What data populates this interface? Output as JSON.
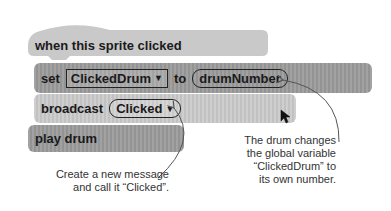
{
  "blocks": {
    "hat": {
      "label": "when this sprite clicked"
    },
    "set": {
      "keyword": "set",
      "variable": "ClickedDrum",
      "to_label": "to",
      "value": "drumNumber"
    },
    "broadcast": {
      "keyword": "broadcast",
      "message": "Clicked"
    },
    "play": {
      "label": "play drum"
    }
  },
  "icons": {
    "dropdown_caret": "▼",
    "cursor": "mouse-pointer"
  },
  "annotations": {
    "left": [
      "Create a new message",
      "and call it “Clicked”."
    ],
    "right": [
      "The drum changes",
      "the global variable",
      "“ClickedDrum” to",
      "its own number."
    ]
  },
  "colors": {
    "hat_block": "#c9c9c9",
    "set_block": "#9b9b9b",
    "broadcast_block": "#c9c9c9",
    "play_block": "#9b9b9b",
    "arrow": "#555555"
  }
}
